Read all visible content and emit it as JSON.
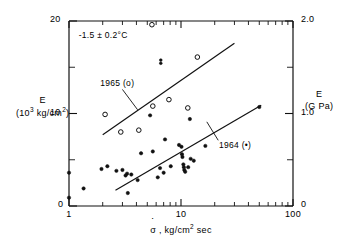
{
  "chart_data": {
    "type": "scatter",
    "title": "",
    "xlabel": "σ̇ , kg/cm² sec",
    "ylabel": "E (10³ kg/cm²)",
    "y2label": "E (G Pa)",
    "xscale": "log",
    "xlim": [
      1,
      100
    ],
    "ylim": [
      0,
      20
    ],
    "y2lim": [
      0,
      2.0
    ],
    "grid": false,
    "legend_position": "inline-annotations",
    "x_tick_labels": [
      "1",
      "10",
      "100"
    ],
    "x_tick_values": [
      1,
      10,
      100
    ],
    "y_tick_labels": [
      "0",
      "10",
      "20"
    ],
    "y_tick_values": [
      0,
      10,
      20
    ],
    "y_minor_ticks": [
      5,
      15
    ],
    "y2_tick_labels": [
      "0",
      "1.0",
      "2.0"
    ],
    "y2_tick_values": [
      0,
      1.0,
      2.0
    ],
    "y2_minor_ticks": [
      0.5,
      1.5
    ],
    "annotations": [
      {
        "name": "temperature",
        "text": "-1.5 ± 0.2°C",
        "x": 1.25,
        "y": 18.6
      },
      {
        "name": "legend-1965",
        "text": "1965 (o)",
        "x": 2.0,
        "y": 13.2
      },
      {
        "name": "legend-1964",
        "text": "1964 (•)",
        "x": 22.0,
        "y": 6.6
      }
    ],
    "series": [
      {
        "name": "1965 (o)",
        "marker": "open-circle",
        "points": [
          {
            "x": 5.5,
            "y": 19.6
          },
          {
            "x": 2.1,
            "y": 9.9
          },
          {
            "x": 2.9,
            "y": 8.0
          },
          {
            "x": 4.2,
            "y": 8.2
          },
          {
            "x": 5.6,
            "y": 10.8
          },
          {
            "x": 7.8,
            "y": 11.5
          },
          {
            "x": 11.5,
            "y": 10.6
          },
          {
            "x": 14.0,
            "y": 16.1
          }
        ],
        "fit_line": {
          "x1": 2.0,
          "y1": 7.7,
          "x2": 30.0,
          "y2": 17.6
        }
      },
      {
        "name": "1964 (•)",
        "marker": "filled-circle",
        "points": [
          {
            "x": 1.0,
            "y": 3.6
          },
          {
            "x": 1.0,
            "y": 0.9
          },
          {
            "x": 1.35,
            "y": 1.9
          },
          {
            "x": 1.95,
            "y": 4.0
          },
          {
            "x": 2.2,
            "y": 4.3
          },
          {
            "x": 2.65,
            "y": 3.8
          },
          {
            "x": 3.0,
            "y": 3.9
          },
          {
            "x": 3.2,
            "y": 3.3
          },
          {
            "x": 3.3,
            "y": 3.5
          },
          {
            "x": 3.35,
            "y": 1.4
          },
          {
            "x": 3.6,
            "y": 3.4
          },
          {
            "x": 4.1,
            "y": 2.8
          },
          {
            "x": 4.4,
            "y": 5.7
          },
          {
            "x": 5.3,
            "y": 9.8
          },
          {
            "x": 5.6,
            "y": 5.9
          },
          {
            "x": 6.2,
            "y": 3.1
          },
          {
            "x": 6.5,
            "y": 4.1
          },
          {
            "x": 7.0,
            "y": 3.6
          },
          {
            "x": 7.2,
            "y": 7.2
          },
          {
            "x": 8.1,
            "y": 4.3
          },
          {
            "x": 9.6,
            "y": 6.6
          },
          {
            "x": 10.1,
            "y": 6.4
          },
          {
            "x": 10.2,
            "y": 5.6
          },
          {
            "x": 10.3,
            "y": 5.3
          },
          {
            "x": 10.5,
            "y": 4.5
          },
          {
            "x": 10.6,
            "y": 4.2
          },
          {
            "x": 10.7,
            "y": 3.9
          },
          {
            "x": 10.9,
            "y": 3.7
          },
          {
            "x": 11.6,
            "y": 4.2
          },
          {
            "x": 12.0,
            "y": 9.4
          },
          {
            "x": 12.2,
            "y": 5.1
          },
          {
            "x": 13.0,
            "y": 4.9
          },
          {
            "x": 16.5,
            "y": 6.5
          },
          {
            "x": 50.0,
            "y": 10.7
          }
        ],
        "fit_line": {
          "x1": 2.6,
          "y1": 1.7,
          "x2": 52.0,
          "y2": 10.9
        }
      }
    ],
    "stray_marks": [
      {
        "name": "stray-symbol",
        "x": 6.6,
        "y": 15.6
      }
    ]
  }
}
